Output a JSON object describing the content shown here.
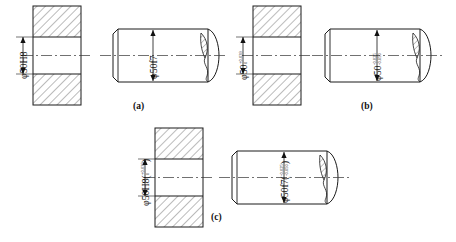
{
  "drawing": {
    "title": "Hole and shaft fit dimensioning methods",
    "line_color": "#1a1a1a",
    "hatch_color": "#555555",
    "center_line_color": "#333333"
  },
  "panels": [
    {
      "id": "a",
      "caption": "(a)",
      "method": "tolerance-class-only",
      "hole": {
        "label_phi": "φ",
        "label_base": "50H8",
        "upper_dev": "",
        "lower_dev": "",
        "nominal": "50",
        "code": "H8"
      },
      "shaft": {
        "label_phi": "φ",
        "label_base": "50f7",
        "upper_dev": "",
        "lower_dev": "",
        "nominal": "50",
        "code": "f7"
      }
    },
    {
      "id": "b",
      "caption": "(b)",
      "method": "deviation-values-only",
      "hole": {
        "label_phi": "φ",
        "label_base": "50",
        "upper_dev": "+0.039",
        "lower_dev": "0",
        "nominal": "50",
        "code": ""
      },
      "shaft": {
        "label_phi": "φ",
        "label_base": "50",
        "upper_dev": "-0.025",
        "lower_dev": "-0.050",
        "nominal": "50",
        "code": ""
      }
    },
    {
      "id": "c",
      "caption": "(c)",
      "method": "code-and-deviations",
      "hole": {
        "label_phi": "φ",
        "label_base": "50H8(",
        "label_tail": ")",
        "upper_dev": "+0.039",
        "lower_dev": "0",
        "nominal": "50",
        "code": "H8"
      },
      "shaft": {
        "label_phi": "φ",
        "label_base": "50f7(",
        "label_tail": ")",
        "upper_dev": "-0.025",
        "lower_dev": "-0.050",
        "nominal": "50",
        "code": "f7"
      }
    }
  ]
}
